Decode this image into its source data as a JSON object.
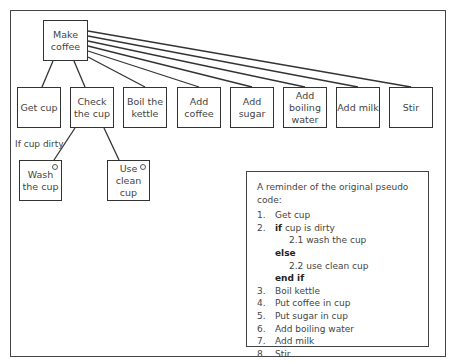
{
  "diagram": {
    "root": {
      "label": "Make coffee"
    },
    "children": [
      {
        "label": "Get cup"
      },
      {
        "label": "Check the cup"
      },
      {
        "label": "Boil the kettle"
      },
      {
        "label": "Add coffee"
      },
      {
        "label": "Add sugar"
      },
      {
        "label": "Add boiling water"
      },
      {
        "label": "Add milk"
      },
      {
        "label": "Stir"
      }
    ],
    "selection": {
      "condition_label": "If cup dirty",
      "options": [
        {
          "label": "Wash the cup",
          "marker": "selection-circle"
        },
        {
          "label": "Use clean cup",
          "marker": "selection-circle"
        }
      ]
    }
  },
  "reminder": {
    "title": "A reminder of the original pseudo code:",
    "lines": [
      {
        "num": "1.",
        "text": "Get cup"
      },
      {
        "num": "2.",
        "kw": "if",
        "text": " cup is dirty"
      },
      {
        "sub": "2.1 wash the cup"
      },
      {
        "keyword": "else"
      },
      {
        "sub": "2.2 use clean cup"
      },
      {
        "keyword": "end if"
      },
      {
        "num": "3.",
        "text": "Boil kettle"
      },
      {
        "num": "4.",
        "text": "Put coffee in cup"
      },
      {
        "num": "5.",
        "text": "Put sugar in cup"
      },
      {
        "num": "6.",
        "text": "Add boiling water"
      },
      {
        "num": "7.",
        "text": "Add milk"
      },
      {
        "num": "8.",
        "text": "Stir"
      }
    ]
  }
}
